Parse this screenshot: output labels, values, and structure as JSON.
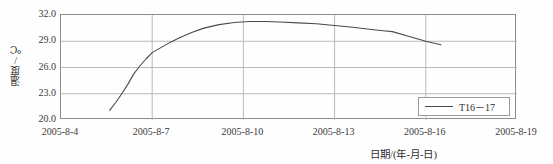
{
  "chart_data": {
    "type": "line",
    "title": "",
    "xlabel": "日期/(年-月-日)",
    "ylabel": "温度/℃",
    "grid": true,
    "legend_position": "bottom-right",
    "xlim": [
      "2005-8-4",
      "2005-8-19"
    ],
    "ylim": [
      20.0,
      32.0
    ],
    "y_ticks": [
      "32.0",
      "29.0",
      "26.0",
      "23.0",
      "20.0"
    ],
    "y_tick_values": [
      32.0,
      29.0,
      26.0,
      23.0,
      20.0
    ],
    "x_ticks": [
      "2005-8-4",
      "2005-8-7",
      "2005-8-10",
      "2005-8-13",
      "2005-8-16",
      "2005-8-19"
    ],
    "series": [
      {
        "name": "T16－17",
        "color": "#4a4a4a",
        "x": [
          "2005-8-5.6",
          "2005-8-5.8",
          "2005-8-6.0",
          "2005-8-6.2",
          "2005-8-6.4",
          "2005-8-6.6",
          "2005-8-6.8",
          "2005-8-7.0",
          "2005-8-7.3",
          "2005-8-7.6",
          "2005-8-7.9",
          "2005-8-8.3",
          "2005-8-8.7",
          "2005-8-9.2",
          "2005-8-9.7",
          "2005-8-10.2",
          "2005-8-10.7",
          "2005-8-11.2",
          "2005-8-11.8",
          "2005-8-12.4",
          "2005-8-13.0",
          "2005-8-13.6",
          "2005-8-14.2",
          "2005-8-14.6",
          "2005-8-14.9",
          "2005-8-15.4",
          "2005-8-16.0",
          "2005-8-16.5"
        ],
        "values": [
          21.1,
          22.0,
          23.0,
          24.1,
          25.3,
          26.2,
          27.0,
          27.7,
          28.3,
          28.9,
          29.4,
          30.0,
          30.5,
          30.9,
          31.15,
          31.25,
          31.25,
          31.2,
          31.1,
          31.0,
          30.8,
          30.6,
          30.35,
          30.2,
          30.1,
          29.6,
          29.0,
          28.6
        ]
      }
    ]
  },
  "legend": {
    "items": [
      {
        "label": "T16－17"
      }
    ]
  },
  "axes": {
    "y_title": "温度/℃",
    "x_title": "日期/(年-月-日)",
    "y_tick_labels": [
      "32.0",
      "29.0",
      "26.0",
      "23.0",
      "20.0"
    ],
    "x_tick_labels": [
      "2005-8-4",
      "2005-8-7",
      "2005-8-10",
      "2005-8-13",
      "2005-8-16",
      "2005-8-19"
    ]
  },
  "colors": {
    "series_line": "#4a4a4a",
    "grid": "#b9b9b9",
    "frame": "#8d8d8d",
    "text": "#3a3a3a",
    "background": "#fefefe"
  }
}
